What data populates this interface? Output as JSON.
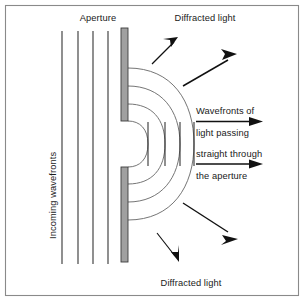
{
  "diagram": {
    "type": "physics-optics-diagram",
    "colors": {
      "background": "#ffffff",
      "frame_border": "#8a8a8a",
      "barrier_fill": "#a0a0a0",
      "barrier_stroke": "#3c3c3c",
      "straight_wavefront": "#2b2b2b",
      "curved_wavefront": "#6e6e6e",
      "arrow": "#111111",
      "text": "#1a1a1a"
    },
    "labels": {
      "aperture": "Aperture",
      "diffracted_light_top": "Diffracted light",
      "diffracted_light_bottom": "Diffracted light",
      "incoming_wavefronts": "Incoming wavefronts",
      "straight_through_line1": "Wavefronts of",
      "straight_through_line2": "light passing",
      "straight_through_line3": "straight through",
      "straight_through_line4": "the aperture"
    },
    "elements": {
      "incoming_wavefront_count": 4,
      "incoming_wavefront_x": [
        62,
        78,
        93,
        108
      ],
      "incoming_wavefront_top": 30,
      "incoming_wavefront_bottom": 265,
      "barrier_x": 121,
      "barrier_width": 7,
      "barrier_top_y1": 28,
      "barrier_top_y2": 121,
      "barrier_bottom_y1": 167,
      "barrier_bottom_y2": 262,
      "aperture_gap_top": 121,
      "aperture_gap_bottom": 167,
      "diffracted_curve_count": 4,
      "straight_through_count": 4,
      "arrow_count": 6
    }
  }
}
